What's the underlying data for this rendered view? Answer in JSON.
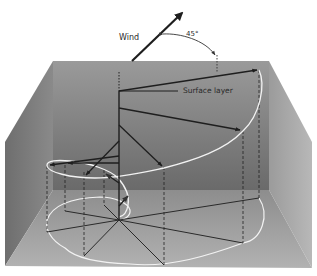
{
  "diagram": {
    "type": "ekman-spiral",
    "labels": {
      "wind": "Wind",
      "angle": "45°",
      "surface_layer": "Surface layer"
    },
    "colors": {
      "background": "#ffffff",
      "back_wall": "#8e8e8e",
      "left_wall": "#7a7a7a",
      "right_wall": "#a9a9a9",
      "floor": "#a6a6a6",
      "arrows": "#1e1e1e",
      "spiral": "#f2f2f2"
    },
    "icons": {
      "wind": "arrow-icon",
      "current_vectors": "arrow-icon"
    }
  }
}
